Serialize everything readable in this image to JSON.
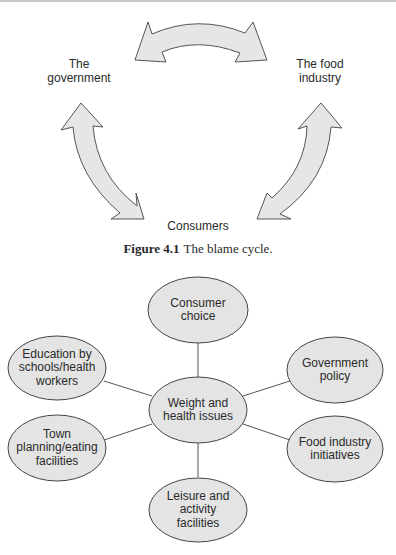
{
  "figure_1": {
    "number": "Figure 4.1",
    "title": "The blame cycle.",
    "nodes": {
      "government": "The\ngovernment",
      "food_industry": "The food\nindustry",
      "consumers": "Consumers"
    },
    "arrows": [
      {
        "from": "government",
        "to": "food_industry",
        "type": "double-headed"
      },
      {
        "from": "government",
        "to": "consumers",
        "type": "double-headed"
      },
      {
        "from": "food_industry",
        "to": "consumers",
        "type": "double-headed"
      }
    ],
    "arrow_fill": "#e6e6e6",
    "arrow_stroke": "#555555"
  },
  "figure_2": {
    "center": "Weight and\nhealth issues",
    "spokes": [
      "Consumer\nchoice",
      "Government\npolicy",
      "Food industry\ninitiatives",
      "Leisure and\nactivity\nfacilities",
      "Town\nplanning/eating\nfacilities",
      "Education by\nschools/health\nworkers"
    ],
    "ellipse_fill": "#e4e4e4",
    "ellipse_stroke": "#444444"
  }
}
